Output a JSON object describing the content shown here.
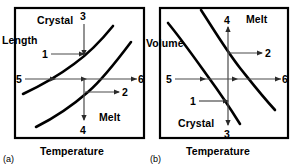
{
  "figure": {
    "type": "technical-diagram",
    "panels": [
      {
        "id": "a",
        "panel_label": "(a)",
        "y_axis_label": "Length",
        "x_axis_label": "Temperature",
        "region_labels": [
          {
            "text": "Crystal",
            "position": "top-left"
          },
          {
            "text": "Melt",
            "position": "bottom-right"
          }
        ],
        "curve_direction": "increasing",
        "curves": [
          {
            "name": "crystal-curve",
            "role": "upper-left"
          },
          {
            "name": "melt-curve",
            "role": "lower-right"
          }
        ],
        "arrows": [
          {
            "label": "1",
            "direction": "right",
            "target": "upper curve"
          },
          {
            "label": "2",
            "direction": "right",
            "target": "from lower curve outward"
          },
          {
            "label": "3",
            "direction": "down",
            "target": "upper curve from top"
          },
          {
            "label": "4",
            "direction": "down",
            "target": "below lower curve"
          },
          {
            "label": "5",
            "direction": "right",
            "target": "crossing both curves"
          },
          {
            "label": "6",
            "direction": "right",
            "target": "outward right"
          }
        ]
      },
      {
        "id": "b",
        "panel_label": "(b)",
        "y_axis_label": "Volume",
        "x_axis_label": "Temperature",
        "region_labels": [
          {
            "text": "Melt",
            "position": "top-right"
          },
          {
            "text": "Crystal",
            "position": "bottom-left"
          }
        ],
        "curve_direction": "decreasing",
        "curves": [
          {
            "name": "crystal-curve",
            "role": "lower-left"
          },
          {
            "name": "melt-curve",
            "role": "upper-right"
          }
        ],
        "arrows": [
          {
            "label": "1",
            "direction": "right",
            "target": "lower curve"
          },
          {
            "label": "2",
            "direction": "right",
            "target": "from upper curve outward"
          },
          {
            "label": "3",
            "direction": "down",
            "target": "below lower curve"
          },
          {
            "label": "4",
            "direction": "up",
            "target": "above upper curve"
          },
          {
            "label": "5",
            "direction": "right",
            "target": "crossing both curves"
          },
          {
            "label": "6",
            "direction": "right",
            "target": "outward right"
          }
        ]
      }
    ]
  },
  "panel_a": {
    "y_label": "Length",
    "x_label": "Temperature",
    "crystal_label": "Crystal",
    "melt_label": "Melt",
    "panel_tag": "(a)",
    "n1": "1",
    "n2": "2",
    "n3": "3",
    "n4": "4",
    "n5": "5",
    "n6": "6"
  },
  "panel_b": {
    "y_label": "Volume",
    "x_label": "Temperature",
    "crystal_label": "Crystal",
    "melt_label": "Melt",
    "panel_tag": "(b)",
    "n1": "1",
    "n2": "2",
    "n3": "3",
    "n4": "4",
    "n5": "5",
    "n6": "6"
  },
  "colors": {
    "background": "#ffffff",
    "frame": "#000000",
    "curve": "#000000",
    "arrow": "#4a4a4a",
    "text": "#000000"
  }
}
